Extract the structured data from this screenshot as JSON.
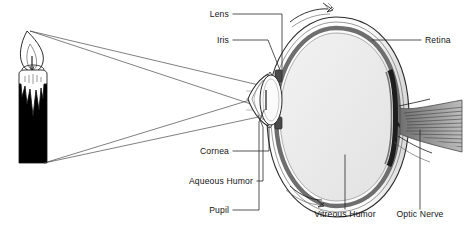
{
  "figure": {
    "background_color": "#ffffff",
    "width": 464,
    "height": 234
  },
  "labels": [
    {
      "id": "lens",
      "text": "Lens",
      "x": 229,
      "y": 17,
      "align": "end"
    },
    {
      "id": "iris",
      "text": "Iris",
      "x": 229,
      "y": 43,
      "align": "end"
    },
    {
      "id": "retina",
      "text": "Retina",
      "x": 417,
      "y": 43,
      "align": "start"
    },
    {
      "id": "cornea",
      "text": "Cornea",
      "x": 229,
      "y": 154,
      "align": "end"
    },
    {
      "id": "aqueous-humor",
      "text": "Aqueous Humor",
      "x": 253,
      "y": 184,
      "align": "end"
    },
    {
      "id": "pupil",
      "text": "Pupil",
      "x": 229,
      "y": 213,
      "align": "end"
    },
    {
      "id": "vitreous-humor",
      "text": "Vitreous Humor",
      "x": 345,
      "y": 217,
      "align": "middle"
    },
    {
      "id": "optic-nerve",
      "text": "Optic Nerve",
      "x": 420,
      "y": 217,
      "align": "middle"
    }
  ],
  "parts": {
    "candle": {
      "name": "candle",
      "body_color": "#000000",
      "wax_color": "#ffffff",
      "flame_color": "#ffffff",
      "outline_color": "#111111"
    },
    "eye": {
      "sclera_color": "#ffffff",
      "vitreous_color": "#ededed",
      "retina_color": "#9a9a9a",
      "choroid_color": "#6e6e6e",
      "lens_color": "#f6f6f6",
      "optic_nerve_color": "#8a8a8a",
      "outline_color": "#2b2b2b"
    },
    "light_rays": {
      "name": "light-rays",
      "color": "#3a3a3a",
      "source_points": [
        "flame-tip",
        "candle-base"
      ],
      "count": 4
    }
  },
  "colors": {
    "ink": "#1a1a1a",
    "label_text": "#141414",
    "leader": "#2a2a2a",
    "ray": "#3a3a3a",
    "grey_fill": "#ededed"
  }
}
